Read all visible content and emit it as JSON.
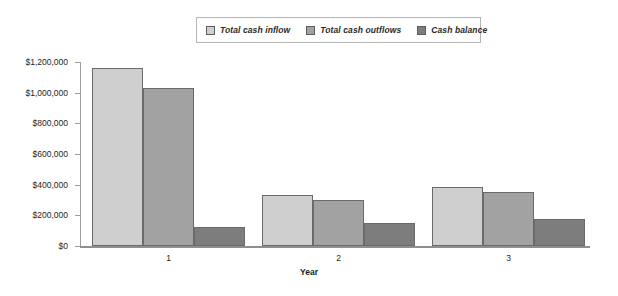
{
  "chart_data": {
    "type": "bar",
    "title": "",
    "subtitle": "",
    "xlabel": "Year",
    "ylabel": "",
    "categories": [
      "1",
      "2",
      "3"
    ],
    "series": [
      {
        "name": "Total cash inflow",
        "color": "#cfcfcf",
        "values": [
          1160000,
          335000,
          385000
        ]
      },
      {
        "name": "Total cash outflows",
        "color": "#a2a2a2",
        "values": [
          1030000,
          302000,
          355000
        ]
      },
      {
        "name": "Cash balance",
        "color": "#7d7d7d",
        "values": [
          125000,
          150000,
          175000
        ]
      }
    ],
    "ylim": [
      0,
      1200000
    ],
    "ytick_values": [
      0,
      200000,
      400000,
      600000,
      800000,
      1000000,
      1200000
    ],
    "ytick_labels": [
      "$0",
      "$200,000",
      "$400,000",
      "$600,000",
      "$800,000",
      "$1,000,000",
      "$1,200,000"
    ],
    "grid": false,
    "legend_position": "top-center",
    "legend_entries": [
      "Total cash inflow",
      "Total cash outflows",
      "Cash balance"
    ]
  },
  "legend": {
    "items": [
      {
        "label": "Total cash inflow"
      },
      {
        "label": "Total cash outflows"
      },
      {
        "label": "Cash balance"
      }
    ]
  },
  "axes": {
    "x_title": "Year",
    "x_categories": [
      "1",
      "2",
      "3"
    ],
    "y_labels": [
      "$1,200,000",
      "$1,000,000",
      "$800,000",
      "$600,000",
      "$400,000",
      "$200,000",
      "$0"
    ]
  },
  "colors": {
    "series_1": "#cfcfcf",
    "series_2": "#a2a2a2",
    "series_3": "#7d7d7d",
    "axis": "#8f8f8f",
    "legend_border": "#b4b4b4",
    "background": "#ffffff"
  }
}
